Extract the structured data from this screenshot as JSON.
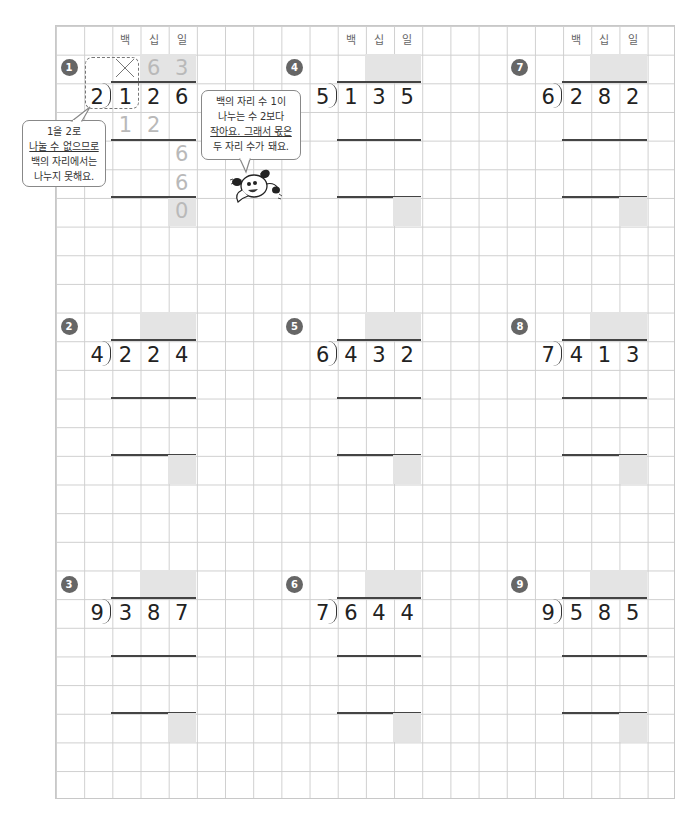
{
  "worksheet": {
    "place_headers": [
      "백",
      "십",
      "일"
    ],
    "example": {
      "number": "1",
      "divisor": "2",
      "dividend": [
        "1",
        "2",
        "6"
      ],
      "quotient": [
        "",
        "6",
        "3"
      ],
      "crossed_hundreds": true,
      "steps": [
        {
          "row": 3,
          "digits": [
            "1",
            "2",
            ""
          ]
        },
        {
          "row": 4,
          "digits": [
            "",
            "",
            "6"
          ]
        },
        {
          "row": 5,
          "digits": [
            "",
            "",
            "6"
          ]
        },
        {
          "row": 6,
          "digits": [
            "",
            "",
            "0"
          ]
        }
      ],
      "bubble_left": [
        "1을 2로",
        "나눌 수 없으므로",
        "백의 자리에서는",
        "나누지 못해요."
      ],
      "bubble_mascot": [
        "백의 자리 수 1이",
        "나누는 수 2보다",
        "작아요. 그래서 몫은",
        "두 자리 수가 돼요."
      ]
    },
    "problems": [
      {
        "number": "2",
        "divisor": "4",
        "dividend": [
          "2",
          "2",
          "4"
        ]
      },
      {
        "number": "3",
        "divisor": "9",
        "dividend": [
          "3",
          "8",
          "7"
        ]
      },
      {
        "number": "4",
        "divisor": "5",
        "dividend": [
          "1",
          "3",
          "5"
        ]
      },
      {
        "number": "5",
        "divisor": "6",
        "dividend": [
          "4",
          "3",
          "2"
        ]
      },
      {
        "number": "6",
        "divisor": "7",
        "dividend": [
          "6",
          "4",
          "4"
        ]
      },
      {
        "number": "7",
        "divisor": "6",
        "dividend": [
          "2",
          "8",
          "2"
        ]
      },
      {
        "number": "8",
        "divisor": "7",
        "dividend": [
          "4",
          "1",
          "3"
        ]
      },
      {
        "number": "9",
        "divisor": "9",
        "dividend": [
          "5",
          "8",
          "5"
        ]
      }
    ]
  },
  "colors": {
    "shade": "#e4e4e4",
    "answer_gray": "#b9b9b9",
    "badge": "#666666",
    "grid": "#cfcfcf"
  }
}
